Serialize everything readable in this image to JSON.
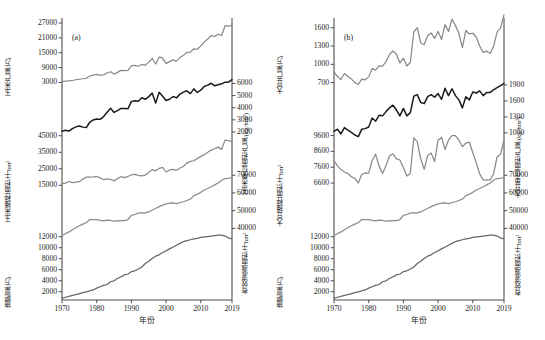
{
  "figure": {
    "panels": [
      {
        "tag": "(a)",
        "crop": "玉米",
        "xaxis": {
          "label": "年份",
          "ticks": [
            "1970",
            "1980",
            "1990",
            "2000",
            "2010",
            "2019"
          ],
          "tickvals": [
            1970,
            1980,
            1990,
            2000,
            2010,
            2019
          ],
          "range": [
            1970,
            2019
          ]
        },
        "blocks": [
          {
            "side": "left",
            "axis_label": "玉米产量/万t",
            "ticks": [
              "27000",
              "21000",
              "15000",
              "9000",
              "3000"
            ],
            "tickvals": [
              27000,
              21000,
              15000,
              9000,
              3000
            ],
            "range": [
              0,
              29000
            ],
            "series": "corn_production"
          },
          {
            "side": "right",
            "axis_label": "玉米单位面积产量/(kg/hm²)",
            "ticks": [
              "6000",
              "5000",
              "4000",
              "3000",
              "2000"
            ],
            "tickvals": [
              6000,
              5000,
              4000,
              3000,
              2000
            ],
            "range": [
              1400,
              6400
            ],
            "series": "corn_yield_per_area"
          },
          {
            "side": "left",
            "axis_label": "玉米播种面积/千hm²",
            "ticks": [
              "45000",
              "35000",
              "25000",
              "15000"
            ],
            "tickvals": [
              45000,
              35000,
              25000,
              15000
            ],
            "range": [
              13000,
              48000
            ],
            "series": "corn_sown_area"
          },
          {
            "side": "right",
            "axis_label": "有效灌溉面积/千hm²",
            "ticks": [
              "70000",
              "60000",
              "50000",
              "40000"
            ],
            "tickvals": [
              70000,
              60000,
              50000,
              40000
            ],
            "range": [
              33000,
              72000
            ],
            "series": "effective_irrigated_area"
          },
          {
            "side": "left",
            "axis_label": "施肥量/万t",
            "ticks": [
              "12000",
              "10000",
              "8000",
              "6000",
              "4000",
              "2000"
            ],
            "tickvals": [
              12000,
              10000,
              8000,
              6000,
              4000,
              2000
            ],
            "range": [
              500,
              12800
            ],
            "series": "fertilizer_use"
          }
        ]
      },
      {
        "tag": "(b)",
        "crop": "大豆",
        "xaxis": {
          "label": "年份",
          "ticks": [
            "1970",
            "1980",
            "1990",
            "2000",
            "2010",
            "2019"
          ],
          "tickvals": [
            1970,
            1980,
            1990,
            2000,
            2010,
            2019
          ],
          "range": [
            1970,
            2019
          ]
        },
        "blocks": [
          {
            "side": "left",
            "axis_label": "大豆产量/万t",
            "ticks": [
              "1600",
              "1300",
              "1000",
              "700"
            ],
            "tickvals": [
              1600,
              1300,
              1000,
              700
            ],
            "range": [
              580,
              1760
            ],
            "series": "soy_production"
          },
          {
            "side": "right",
            "axis_label": "大豆单位面积产量/(kg/hm²)",
            "ticks": [
              "1900",
              "1600",
              "1300",
              "1000"
            ],
            "tickvals": [
              1900,
              1600,
              1300,
              1000
            ],
            "range": [
              880,
              2020
            ],
            "series": "soy_yield_per_area"
          },
          {
            "side": "left",
            "axis_label": "大豆播种面积/千hm²",
            "ticks": [
              "9600",
              "8600",
              "7600",
              "6600"
            ],
            "tickvals": [
              9600,
              8600,
              7600,
              6600
            ],
            "range": [
              6250,
              9900
            ],
            "series": "soy_sown_area"
          },
          {
            "side": "right",
            "axis_label": "有效灌溉面积/千hm²",
            "ticks": [
              "70000",
              "60000",
              "50000",
              "40000"
            ],
            "tickvals": [
              70000,
              60000,
              50000,
              40000
            ],
            "range": [
              33000,
              72000
            ],
            "series": "effective_irrigated_area"
          },
          {
            "side": "left",
            "axis_label": "施肥量/万t",
            "ticks": [
              "12000",
              "10000",
              "8000",
              "6000",
              "4000",
              "2000"
            ],
            "tickvals": [
              12000,
              10000,
              8000,
              6000,
              4000,
              2000
            ],
            "range": [
              500,
              12800
            ],
            "series": "fertilizer_use"
          }
        ]
      }
    ],
    "colors": {
      "gray_line": "#8a8a8a",
      "black_line": "#1a1a1a",
      "dark_gray_line": "#666666",
      "axis": "#4d4d4d",
      "background": "#ffffff"
    }
  },
  "chart_data": {
    "type": "line",
    "title": "",
    "xlabel": "年份",
    "grid": false,
    "legend": "none",
    "x": [
      1970,
      1971,
      1972,
      1973,
      1974,
      1975,
      1976,
      1977,
      1978,
      1979,
      1980,
      1981,
      1982,
      1983,
      1984,
      1985,
      1986,
      1987,
      1988,
      1989,
      1990,
      1991,
      1992,
      1993,
      1994,
      1995,
      1996,
      1997,
      1998,
      1999,
      2000,
      2001,
      2002,
      2003,
      2004,
      2005,
      2006,
      2007,
      2008,
      2009,
      2010,
      2011,
      2012,
      2013,
      2014,
      2015,
      2016,
      2017,
      2018,
      2019
    ],
    "series": [
      {
        "name": "玉米产量/万t",
        "panel": "(a)",
        "axis": "left-top",
        "unit": "万t",
        "color": "#8a8a8a",
        "values": [
          3300,
          3500,
          3600,
          3800,
          4100,
          4300,
          4500,
          4700,
          5600,
          6000,
          6260,
          5920,
          6050,
          6820,
          7330,
          6383,
          7086,
          7924,
          7741,
          7893,
          9682,
          9877,
          9538,
          10270,
          9928,
          11199,
          12747,
          10431,
          13295,
          12809,
          10600,
          11409,
          12131,
          11583,
          13029,
          13937,
          15160,
          15230,
          16591,
          16397,
          17725,
          19278,
          20561,
          21849,
          21565,
          22458,
          21955,
          25907,
          25717,
          26077
        ]
      },
      {
        "name": "玉米单位面积产量/(kg/hm²)",
        "panel": "(a)",
        "axis": "right-top",
        "unit": "kg/hm²",
        "color": "#1a1a1a",
        "values": [
          2060,
          2140,
          2080,
          2280,
          2420,
          2500,
          2400,
          2360,
          2800,
          2990,
          3075,
          3040,
          3270,
          3630,
          3960,
          3610,
          3760,
          3940,
          3930,
          3910,
          4524,
          4576,
          4530,
          4825,
          4693,
          4917,
          5203,
          4388,
          5268,
          4946,
          4598,
          4697,
          4925,
          4813,
          5122,
          5287,
          5396,
          5167,
          5556,
          5258,
          5453,
          5746,
          5868,
          6017,
          5808,
          5893,
          5970,
          6110,
          6104,
          6317
        ]
      },
      {
        "name": "玉米播种面积/千hm²",
        "panel": "(a)",
        "axis": "left-mid",
        "unit": "千hm²",
        "color": "#8a8a8a",
        "values": [
          16000,
          16350,
          17300,
          16680,
          16940,
          17200,
          18750,
          19900,
          19960,
          20133,
          20353,
          19475,
          18503,
          18824,
          18537,
          17694,
          19123,
          20211,
          19691,
          20353,
          21401,
          21574,
          21044,
          20694,
          21152,
          22776,
          24498,
          23775,
          25239,
          25904,
          23056,
          24282,
          24634,
          24068,
          25446,
          26358,
          28463,
          29478,
          29864,
          31183,
          32500,
          33542,
          35030,
          36318,
          37124,
          38122,
          36768,
          42399,
          42130,
          41284
        ]
      },
      {
        "name": "有效灌溉面积/千hm²",
        "panel": "(a),(b)",
        "axis": "right-mid",
        "unit": "千hm²",
        "color": "#8a8a8a",
        "values": [
          36000,
          37000,
          38000,
          39200,
          40400,
          41500,
          42400,
          43200,
          44965,
          45003,
          44888,
          44574,
          44177,
          44644,
          44453,
          44036,
          44226,
          44403,
          44376,
          44917,
          47403,
          47822,
          48590,
          48728,
          48759,
          49281,
          50381,
          51239,
          52296,
          53158,
          53820,
          54249,
          54355,
          54014,
          54478,
          55029,
          55750,
          56518,
          58472,
          59261,
          60348,
          61682,
          62491,
          63473,
          64540,
          65587,
          67141,
          68152,
          68272,
          68679
        ]
      },
      {
        "name": "施肥量/万t",
        "panel": "(a),(b)",
        "axis": "left-bottom",
        "unit": "万t",
        "color": "#666666",
        "values": [
          1000,
          1200,
          1400,
          1600,
          1800,
          2000,
          2200,
          2400,
          2590,
          2800,
          3200,
          3500,
          3800,
          4000,
          4600,
          4800,
          5300,
          5700,
          6100,
          6300,
          6800,
          7000,
          7400,
          7800,
          8600,
          9100,
          9700,
          10200,
          10500,
          11000,
          11400,
          11800,
          12200,
          12600,
          13000,
          13400,
          13600,
          13800,
          14000,
          14100,
          14300,
          14400,
          14500,
          14600,
          14700,
          14800,
          14800,
          14600,
          14200,
          14000
        ],
        "note": "displayed values scaled to axis 2000-12000"
      },
      {
        "name": "大豆产量/万t",
        "panel": "(b)",
        "axis": "left-top",
        "unit": "万t",
        "color": "#8a8a8a",
        "values": [
          872,
          800,
          750,
          850,
          800,
          760,
          700,
          670,
          757,
          746,
          794,
          933,
          903,
          976,
          970,
          1050,
          1161,
          1218,
          1165,
          1023,
          1100,
          972,
          1030,
          1531,
          1600,
          1350,
          1322,
          1473,
          1515,
          1425,
          1541,
          1405,
          1651,
          1539,
          1740,
          1635,
          1508,
          1273,
          1555,
          1498,
          1510,
          1449,
          1301,
          1195,
          1215,
          1179,
          1294,
          1528,
          1597,
          1810
        ]
      },
      {
        "name": "大豆单位面积产量/(kg/hm²)",
        "panel": "(b)",
        "axis": "right-top",
        "unit": "kg/hm²",
        "color": "#1a1a1a",
        "values": [
          1030,
          1070,
          980,
          1100,
          1050,
          1010,
          960,
          930,
          1070,
          1080,
          1110,
          1280,
          1220,
          1330,
          1320,
          1400,
          1470,
          1520,
          1430,
          1320,
          1460,
          1320,
          1380,
          1690,
          1720,
          1570,
          1550,
          1680,
          1720,
          1670,
          1740,
          1630,
          1840,
          1700,
          1830,
          1700,
          1620,
          1470,
          1680,
          1620,
          1770,
          1750,
          1790,
          1700,
          1760,
          1760,
          1810,
          1850,
          1890,
          1930
        ]
      },
      {
        "name": "大豆播种面积/千hm²",
        "panel": "(b)",
        "axis": "left-mid",
        "unit": "千hm²",
        "color": "#8a8a8a",
        "values": [
          8000,
          7700,
          7450,
          7300,
          7200,
          7000,
          6900,
          6600,
          7144,
          7247,
          7227,
          8025,
          8420,
          7670,
          7200,
          7716,
          8305,
          8446,
          8130,
          8057,
          7560,
          7040,
          7220,
          9450,
          9220,
          8130,
          7470,
          8346,
          8500,
          7962,
          9307,
          9482,
          8720,
          9313,
          9590,
          9591,
          9304,
          8890,
          9127,
          9190,
          8516,
          7888,
          7175,
          6790,
          6800,
          6800,
          7192,
          8246,
          8413,
          9332
        ]
      }
    ]
  }
}
